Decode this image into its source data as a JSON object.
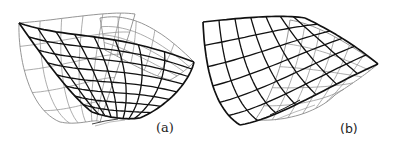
{
  "figure": {
    "panels": [
      {
        "id": "a",
        "label": "(a)",
        "description": "3D wireframe surface with a curved valley",
        "front_grid": {
          "u_lines": 9,
          "v_lines": 9
        },
        "back_grid": {
          "u_lines": 7,
          "v_lines": 6
        },
        "colors": {
          "front": "#111111",
          "back": "#8a8a8a"
        }
      },
      {
        "id": "b",
        "label": "(b)",
        "description": "3D wireframe surface with a curved valley, alternate view",
        "front_grid": {
          "u_lines": 8,
          "v_lines": 7
        },
        "back_grid": {
          "u_lines": 7,
          "v_lines": 6
        },
        "colors": {
          "front": "#111111",
          "back": "#8a8a8a"
        }
      }
    ]
  }
}
